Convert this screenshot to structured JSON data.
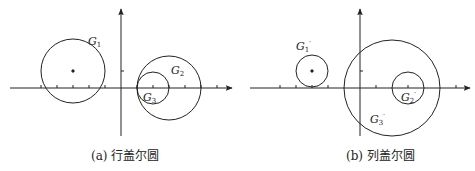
{
  "panels": [
    {
      "id": "a",
      "caption": "(a) 行盖尔圆",
      "circles": [
        {
          "label": "G",
          "sub": "1",
          "prime": false,
          "cx": 73,
          "cy": 71,
          "r": 32,
          "center_dot": true,
          "lx": 88,
          "ly": 45
        },
        {
          "label": "G",
          "sub": "2",
          "prime": false,
          "cx": 169,
          "cy": 88,
          "r": 32,
          "center_dot": false,
          "lx": 171,
          "ly": 74
        },
        {
          "label": "G",
          "sub": "3",
          "prime": false,
          "cx": 153,
          "cy": 88,
          "r": 16,
          "center_dot": false,
          "lx": 143,
          "ly": 100
        }
      ]
    },
    {
      "id": "b",
      "caption": "(b) 列盖尔圆",
      "circles": [
        {
          "label": "G",
          "sub": "1",
          "prime": true,
          "cx": 312,
          "cy": 71,
          "r": 16,
          "center_dot": true,
          "lx": 296,
          "ly": 50
        },
        {
          "label": "G",
          "sub": "2",
          "prime": true,
          "cx": 408,
          "cy": 88,
          "r": 16,
          "center_dot": false,
          "lx": 401,
          "ly": 100
        },
        {
          "label": "G",
          "sub": "3",
          "prime": true,
          "cx": 392,
          "cy": 88,
          "r": 48,
          "center_dot": false,
          "lx": 370,
          "ly": 122
        }
      ]
    }
  ]
}
